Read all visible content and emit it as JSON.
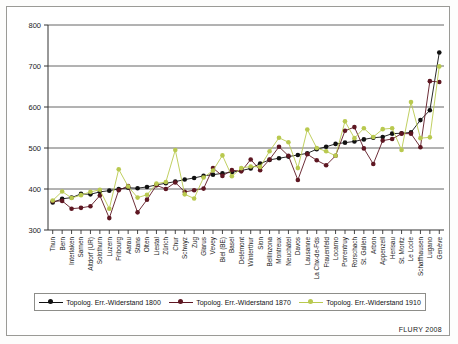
{
  "credit": "FLURY 2008",
  "colors": {
    "series1": "#111111",
    "series2": "#5e1722",
    "series3": "#b9c94f",
    "grid": "#555555",
    "axis": "#333333",
    "frame": "#9a9a96"
  },
  "legend": {
    "position": "bottom",
    "items": [
      {
        "label": "Topolog. Err.-Widerstand 1800",
        "color": "#111111"
      },
      {
        "label": "Topolog. Err.-Widerstand 1870",
        "color": "#5e1722"
      },
      {
        "label": "Topolog. Err.-Widerstand 1910",
        "color": "#b9c94f"
      }
    ]
  },
  "chart_data": {
    "type": "line",
    "title": "",
    "subtitle": "",
    "xlabel": "",
    "ylabel": "",
    "ylim": [
      300,
      800
    ],
    "yticks": [
      300,
      400,
      500,
      600,
      700,
      800
    ],
    "grid": true,
    "legend_position": "bottom",
    "annotations": [
      "FLURY 2008"
    ],
    "categories": [
      "Thun",
      "Bern",
      "Interlaken",
      "Sarnen",
      "Altdorf (UR)",
      "Solothurn",
      "Luzern",
      "Fribourg",
      "Aarau",
      "Stans",
      "Olten",
      "Liestal",
      "Zürich",
      "Chur",
      "Schwyz",
      "Zug",
      "Glarus",
      "Vevey",
      "Biel (BE)",
      "Basel",
      "Delémont",
      "Winterthur",
      "Sion",
      "Bellinzona",
      "Montreux",
      "Neuchâtel",
      "Davos",
      "Lausanne",
      "La Chx-de-Fds",
      "Frauenfeld",
      "Locarno",
      "Porrentruy",
      "Rorschach",
      "St. Gallen",
      "Arbon",
      "Appenzell",
      "Herisau",
      "St. Moritz",
      "Le Locle",
      "Schaffhausen",
      "Lugano",
      "Genève"
    ],
    "series": [
      {
        "name": "Topolog. Err.-Widerstand 1800",
        "color": "#111111",
        "values": [
          367,
          376,
          379,
          388,
          387,
          393,
          396,
          400,
          403,
          402,
          405,
          410,
          414,
          418,
          423,
          427,
          432,
          435,
          438,
          441,
          445,
          450,
          462,
          471,
          475,
          479,
          483,
          487,
          497,
          503,
          510,
          513,
          516,
          521,
          525,
          527,
          535,
          536,
          538,
          568,
          592,
          733
        ]
      },
      {
        "name": "Topolog. Err.-Widerstand 1870",
        "color": "#5e1722",
        "values": [
          370,
          371,
          352,
          354,
          358,
          384,
          329,
          397,
          407,
          343,
          374,
          409,
          400,
          416,
          393,
          397,
          401,
          451,
          432,
          446,
          443,
          472,
          446,
          472,
          503,
          481,
          422,
          485,
          470,
          458,
          481,
          542,
          551,
          499,
          461,
          518,
          522,
          535,
          535,
          502,
          663,
          661
        ]
      },
      {
        "name": "Topolog. Err.-Widerstand 1910",
        "color": "#b9c94f",
        "values": [
          372,
          394,
          378,
          385,
          393,
          398,
          352,
          448,
          406,
          379,
          386,
          413,
          417,
          495,
          387,
          377,
          428,
          445,
          482,
          431,
          451,
          455,
          454,
          492,
          525,
          514,
          451,
          545,
          500,
          492,
          481,
          565,
          524,
          548,
          527,
          546,
          548,
          495,
          612,
          524,
          526,
          699
        ]
      }
    ]
  }
}
